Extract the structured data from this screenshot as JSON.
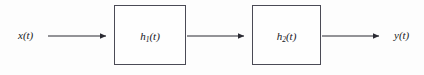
{
  "figure": {
    "type": "block-diagram",
    "background_color": "#fdfdfd",
    "stroke_color": "#2b2b33",
    "block_border_color": "#4a4a55",
    "block_fill_color": "#fefefe",
    "text_color": "#15151c"
  },
  "signals": {
    "input": {
      "label": "x(t)",
      "base": "x",
      "argument": "(t)"
    },
    "output": {
      "label": "y(t)",
      "base": "y",
      "argument": "(t)"
    }
  },
  "blocks": [
    {
      "id": "block-1",
      "base": "h",
      "subscript": "1",
      "argument": "(t)",
      "label": "h1(t)",
      "x": 114,
      "y": 5,
      "width": 72,
      "height": 60
    },
    {
      "id": "block-2",
      "base": "h",
      "subscript": "2",
      "argument": "(t)",
      "label": "h2(t)",
      "x": 252,
      "y": 5,
      "width": 69,
      "height": 60
    }
  ],
  "arrows": [
    {
      "id": "arrow-input",
      "from": "x(t)",
      "to": "h1(t)",
      "x1": 48,
      "x2": 113,
      "y": 36
    },
    {
      "id": "arrow-middle",
      "from": "h1(t)",
      "to": "h2(t)",
      "x1": 187,
      "x2": 251,
      "y": 36
    },
    {
      "id": "arrow-output",
      "from": "h2(t)",
      "to": "y(t)",
      "x1": 322,
      "x2": 386,
      "y": 36
    }
  ],
  "labels": {
    "input_x": 18,
    "input_y": 36,
    "output_x": 394,
    "output_y": 36
  }
}
